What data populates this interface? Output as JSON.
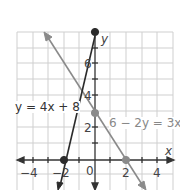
{
  "diagram": {
    "type": "coordinate-plane",
    "x_axis_label": "x",
    "y_axis_label": "y",
    "x_ticks": [
      {
        "value": -4,
        "label": "−4"
      },
      {
        "value": -2,
        "label": "−2"
      },
      {
        "value": 0,
        "label": "0"
      },
      {
        "value": 2,
        "label": "2"
      },
      {
        "value": 4,
        "label": "4"
      }
    ],
    "y_ticks": [
      {
        "value": 2,
        "label": "2"
      },
      {
        "value": 4,
        "label": "4"
      },
      {
        "value": 6,
        "label": "6"
      }
    ],
    "lines": [
      {
        "equation": "y = 4x + 8",
        "color": "#333333",
        "points": [
          {
            "x": -2,
            "y": 0
          },
          {
            "x": 0,
            "y": 8
          }
        ]
      },
      {
        "equation": "6 − 2y = 3x",
        "color": "#888888",
        "points": [
          {
            "x": 0,
            "y": 3
          },
          {
            "x": 2,
            "y": 0
          }
        ]
      }
    ]
  },
  "labels": {
    "line1": "y = 4x + 8",
    "line2": "6 − 2y = 3x",
    "x_axis": "x",
    "y_axis": "y",
    "tick_x_m4": "−4",
    "tick_x_m2": "−2",
    "tick_x_0": "0",
    "tick_x_2": "2",
    "tick_x_4": "4",
    "tick_y_2": "2",
    "tick_y_4": "4",
    "tick_y_6": "6"
  }
}
